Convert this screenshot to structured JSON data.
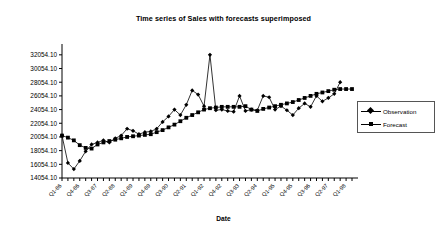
{
  "chart_data": {
    "type": "line",
    "title": "Time series of Sales with forecasts superimposed",
    "xlabel": "Date",
    "ylabel": "",
    "ylim": [
      14054.1,
      33054.1
    ],
    "ytick_values": [
      14054.1,
      16054.1,
      18054.1,
      20054.1,
      22054.1,
      24054.1,
      26054.1,
      28054.1,
      30054.1,
      32054.1
    ],
    "ytick_labels": [
      "14054.10",
      "16054.10",
      "18054.10",
      "20054.10",
      "22054.10",
      "24054.10",
      "26054.10",
      "28054.10",
      "30054.10",
      "32054.10"
    ],
    "grid": false,
    "legend_position": "right",
    "xtick_label_rotation": -45,
    "xtick_label_every": 3,
    "x": [
      "Q1-86",
      "Q2-86",
      "Q3-86",
      "Q4-86",
      "Q1-87",
      "Q2-87",
      "Q3-87",
      "Q4-87",
      "Q1-88",
      "Q2-88",
      "Q3-88",
      "Q4-88",
      "Q1-89",
      "Q2-89",
      "Q3-89",
      "Q4-89",
      "Q1-90",
      "Q2-90",
      "Q3-90",
      "Q4-90",
      "Q1-91",
      "Q2-91",
      "Q3-91",
      "Q4-91",
      "Q1-92",
      "Q2-92",
      "Q3-92",
      "Q4-92",
      "Q1-93",
      "Q2-93",
      "Q3-93",
      "Q4-93",
      "Q1-94",
      "Q2-94",
      "Q3-94",
      "Q4-94",
      "Q1-95",
      "Q2-95",
      "Q3-95",
      "Q4-95",
      "Q1-96",
      "Q2-96",
      "Q3-96",
      "Q4-96",
      "Q1-97",
      "Q2-97",
      "Q3-97",
      "Q4-97",
      "Q1-98",
      "Q2-98"
    ],
    "xtick_labels_shown": [
      "Q1-86",
      "Q4-86",
      "Q3-87",
      "Q2-88",
      "Q1-89",
      "Q4-89",
      "Q3-90",
      "Q2-91",
      "Q1-92",
      "Q4-92",
      "Q3-93",
      "Q2-94",
      "Q1-95",
      "Q4-95",
      "Q3-96",
      "Q2-97",
      "Q1-98"
    ],
    "series": [
      {
        "name": "Observation",
        "marker": "diamond",
        "color": "#000000",
        "values": [
          20254,
          16254,
          15354,
          16554,
          17954,
          18954,
          19254,
          19554,
          19254,
          19854,
          20254,
          21254,
          20954,
          20454,
          20754,
          20854,
          21254,
          22254,
          23054,
          24054,
          23254,
          24754,
          26854,
          26254,
          24554,
          32054,
          23954,
          24054,
          23854,
          23754,
          26054,
          23854,
          24054,
          23954,
          26054,
          25854,
          24054,
          24554,
          23954,
          23254,
          24254,
          24954,
          24454,
          26054,
          25254,
          25754,
          26354,
          28054,
          null,
          null
        ]
      },
      {
        "name": "Forecast",
        "marker": "square",
        "color": "#000000",
        "values": [
          20254,
          19954,
          19554,
          18854,
          18454,
          18354,
          18954,
          19254,
          19454,
          19654,
          19854,
          20054,
          20154,
          20254,
          20354,
          20454,
          20754,
          21054,
          21454,
          21854,
          22354,
          22854,
          23254,
          23654,
          24054,
          24254,
          24354,
          24454,
          24454,
          24454,
          24454,
          24554,
          24054,
          23854,
          24154,
          24354,
          24554,
          24754,
          24954,
          25154,
          25454,
          25754,
          26054,
          26354,
          26554,
          26754,
          26954,
          27054,
          27054,
          27054
        ]
      }
    ]
  },
  "legend": {
    "entries": [
      {
        "label": "Observation",
        "marker": "diamond"
      },
      {
        "label": "Forecast",
        "marker": "square"
      }
    ]
  }
}
